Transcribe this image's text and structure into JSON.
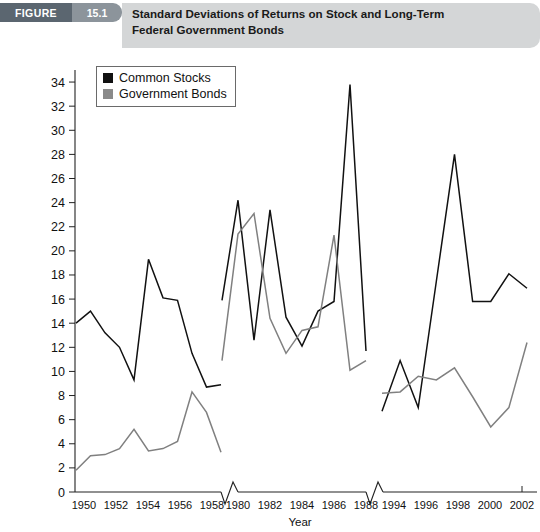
{
  "header": {
    "figure_word": "FIGURE",
    "figure_number": "15.1",
    "title": "Standard Deviations of Returns on Stock and Long-Term Federal Government Bonds"
  },
  "legend": {
    "items": [
      {
        "label": "Common Stocks",
        "color": "#111111",
        "swatch": "black-square-icon"
      },
      {
        "label": "Government Bonds",
        "color": "#8a8a8a",
        "swatch": "gray-square-icon"
      }
    ]
  },
  "chart_data": {
    "type": "line",
    "title": "Standard Deviations of Returns on Stock and Long-Term Federal Government Bonds",
    "xlabel": "Year",
    "ylabel": "",
    "ylim": [
      0,
      35
    ],
    "yticks": [
      2,
      4,
      6,
      8,
      10,
      12,
      14,
      16,
      18,
      20,
      22,
      24,
      26,
      28,
      30,
      32,
      34
    ],
    "grid": false,
    "legend_position": "top-left",
    "axis_breaks": 2,
    "segments": [
      {
        "name": "1950s",
        "x": [
          1950,
          1951,
          1952,
          1953,
          1954,
          1955,
          1956,
          1957,
          1958,
          1959
        ],
        "xticks": [
          1950,
          1952,
          1954,
          1956,
          1958
        ],
        "series": [
          {
            "name": "Common Stocks",
            "values": [
              14.0,
              15.0,
              13.2,
              12.0,
              9.3,
              19.3,
              16.1,
              15.9,
              11.5,
              8.7,
              8.9
            ]
          },
          {
            "name": "Government Bonds",
            "values": [
              1.8,
              3.0,
              3.1,
              3.6,
              5.2,
              3.4,
              3.6,
              4.2,
              8.3,
              6.6,
              3.3
            ]
          }
        ]
      },
      {
        "name": "1980s",
        "x": [
          1979,
          1980,
          1981,
          1982,
          1983,
          1984,
          1985,
          1986,
          1987,
          1988
        ],
        "xticks": [
          1980,
          1982,
          1984,
          1986,
          1988
        ],
        "series": [
          {
            "name": "Common Stocks",
            "values": [
              15.9,
              24.2,
              12.6,
              23.4,
              14.5,
              12.1,
              15.0,
              15.8,
              33.8,
              11.7
            ]
          },
          {
            "name": "Government Bonds",
            "values": [
              10.9,
              21.4,
              23.1,
              14.4,
              11.5,
              13.4,
              13.7,
              21.3,
              10.1,
              10.9
            ]
          }
        ]
      },
      {
        "name": "1990s-2000s",
        "x": [
          1993,
          1994,
          1995,
          1996,
          1997,
          1998,
          1999,
          2000,
          2001,
          2002
        ],
        "xticks": [
          1994,
          1996,
          1998,
          2000,
          2002
        ],
        "series": [
          {
            "name": "Common Stocks",
            "values": [
              6.7,
              10.9,
              7.0,
              17.5,
              28.0,
              15.8,
              15.8,
              18.1,
              16.9
            ]
          },
          {
            "name": "Government Bonds",
            "values": [
              8.2,
              8.3,
              9.6,
              9.3,
              10.3,
              7.9,
              5.4,
              7.0,
              12.4
            ]
          }
        ]
      }
    ]
  },
  "axis": {
    "y_tick_labels": [
      "34",
      "32",
      "30",
      "28",
      "26",
      "24",
      "22",
      "20",
      "18",
      "16",
      "14",
      "12",
      "10",
      "8",
      "6",
      "4",
      "2",
      "0"
    ],
    "x_tick_labels_seg1": [
      "1950",
      "1952",
      "1954",
      "1956",
      "1958"
    ],
    "x_tick_labels_seg2": [
      "1980",
      "1982",
      "1984",
      "1986",
      "1988"
    ],
    "x_tick_labels_seg3": [
      "1994",
      "1996",
      "1998",
      "2000",
      "2002"
    ],
    "x_axis_title": "Year"
  }
}
